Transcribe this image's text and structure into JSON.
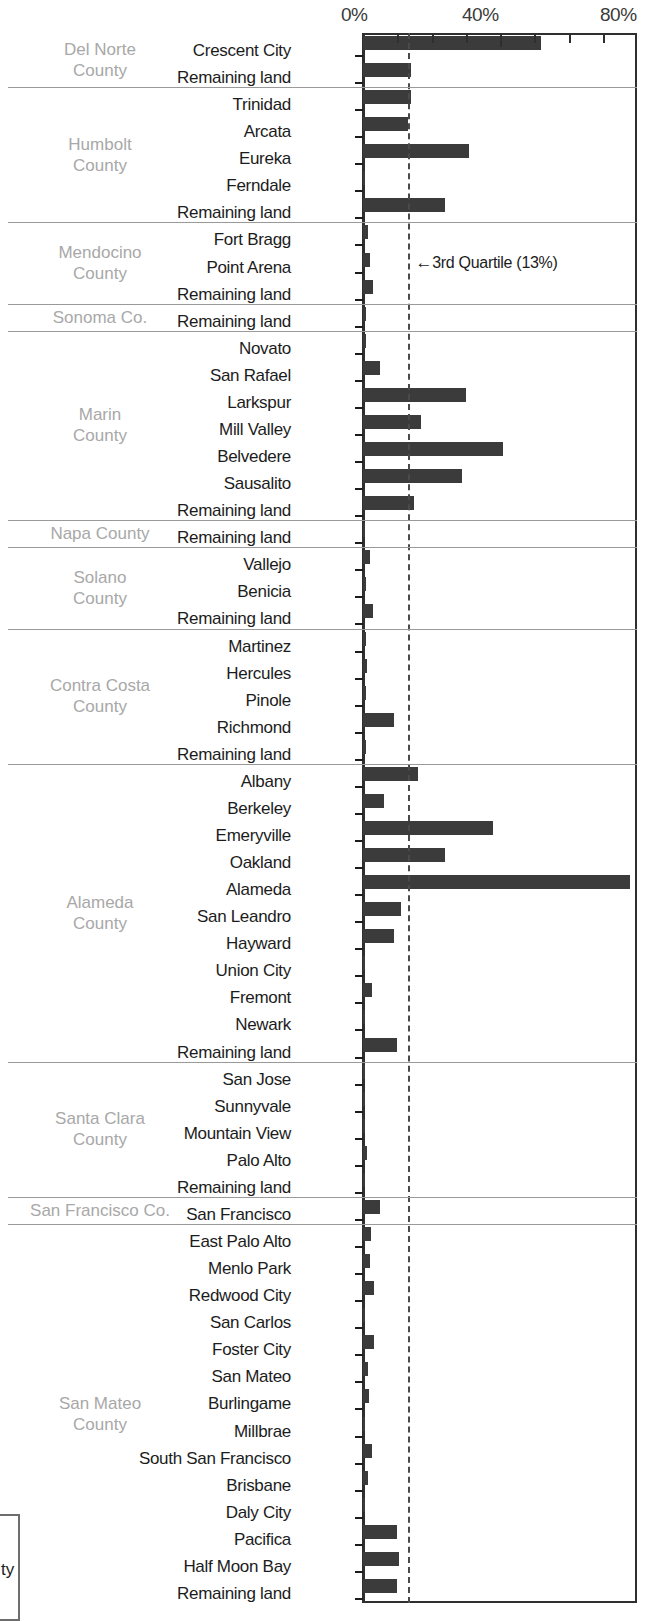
{
  "chart_data": {
    "type": "bar",
    "orientation": "horizontal",
    "title": "",
    "xlabel": "",
    "ylabel": "",
    "xlim": [
      0,
      80
    ],
    "xtick_labels": [
      "0%",
      "40%",
      "80%"
    ],
    "xtick_values": [
      0,
      40,
      80
    ],
    "xtick_minor_values": [
      10,
      20,
      30,
      50,
      60,
      70
    ],
    "grid": false,
    "legend": null,
    "bar_color": "#3b3b3b",
    "annotations": [
      {
        "name": "third-quartile",
        "label": "3rd Quartile (13%)",
        "arrow": "←",
        "value": 13,
        "style": "dashed"
      }
    ],
    "groups": [
      {
        "county": "Del Norte County",
        "county_lines": [
          "Del Norte",
          "County"
        ],
        "categories": [
          "Crescent City",
          "Remaining land"
        ],
        "values": [
          52.0,
          14.0
        ]
      },
      {
        "county": "Humbolt County",
        "county_lines": [
          "Humbolt",
          "County"
        ],
        "categories": [
          "Trinidad",
          "Arcata",
          "Eureka",
          "Ferndale",
          "Remaining land"
        ],
        "values": [
          14.0,
          13.0,
          31.0,
          0.4,
          24.0
        ]
      },
      {
        "county": "Mendocino County",
        "county_lines": [
          "Mendocino",
          "County"
        ],
        "categories": [
          "Fort Bragg",
          "Point Arena",
          "Remaining land"
        ],
        "values": [
          1.5,
          2.0,
          3.0
        ]
      },
      {
        "county": "Sonoma Co.",
        "county_lines": [
          "Sonoma Co."
        ],
        "categories": [
          "Remaining land"
        ],
        "values": [
          1.0
        ]
      },
      {
        "county": "Marin County",
        "county_lines": [
          "Marin",
          "County"
        ],
        "categories": [
          "Novato",
          "San Rafael",
          "Larkspur",
          "Mill Valley",
          "Belvedere",
          "Sausalito",
          "Remaining land"
        ],
        "values": [
          0.8,
          5.0,
          30.0,
          17.0,
          41.0,
          29.0,
          15.0
        ]
      },
      {
        "county": "Napa County",
        "county_lines": [
          "Napa County"
        ],
        "categories": [
          "Remaining land"
        ],
        "values": [
          0.6
        ]
      },
      {
        "county": "Solano County",
        "county_lines": [
          "Solano",
          "County"
        ],
        "categories": [
          "Vallejo",
          "Benicia",
          "Remaining land"
        ],
        "values": [
          2.0,
          0.8,
          3.0
        ]
      },
      {
        "county": "Contra Costa County",
        "county_lines": [
          "Contra Costa",
          "County"
        ],
        "categories": [
          "Martinez",
          "Hercules",
          "Pinole",
          "Richmond",
          "Remaining land"
        ],
        "values": [
          1.0,
          1.2,
          1.0,
          9.0,
          0.8
        ]
      },
      {
        "county": "Alameda County",
        "county_lines": [
          "Alameda",
          "County"
        ],
        "categories": [
          "Albany",
          "Berkeley",
          "Emeryville",
          "Oakland",
          "Alameda",
          "San Leandro",
          "Hayward",
          "Union City",
          "Fremont",
          "Newark",
          "Remaining land"
        ],
        "values": [
          16.0,
          6.0,
          38.0,
          24.0,
          78.0,
          11.0,
          9.0,
          0.5,
          2.5,
          0.6,
          10.0
        ]
      },
      {
        "county": "Santa Clara County",
        "county_lines": [
          "Santa Clara",
          "County"
        ],
        "categories": [
          "San Jose",
          "Sunnyvale",
          "Mountain View",
          "Palo Alto",
          "Remaining land"
        ],
        "values": [
          0.5,
          0.5,
          0.5,
          1.2,
          0.5
        ]
      },
      {
        "county": "San Francisco Co.",
        "county_lines": [
          "San Francisco Co."
        ],
        "categories": [
          "San Francisco"
        ],
        "values": [
          5.0
        ]
      },
      {
        "county": "San Mateo County",
        "county_lines": [
          "San Mateo",
          "County"
        ],
        "categories": [
          "East Palo Alto",
          "Menlo Park",
          "Redwood City",
          "San Carlos",
          "Foster City",
          "San Mateo",
          "Burlingame",
          "Millbrae",
          "South San Francisco",
          "Brisbane",
          "Daly City",
          "Pacifica",
          "Half Moon Bay",
          "Remaining land"
        ],
        "values": [
          2.2,
          2.0,
          3.2,
          0.6,
          3.2,
          1.6,
          1.8,
          0.6,
          2.5,
          1.6,
          0.4,
          10.0,
          10.5,
          10.0
        ]
      }
    ]
  },
  "partial_box": {
    "text": "ty"
  }
}
